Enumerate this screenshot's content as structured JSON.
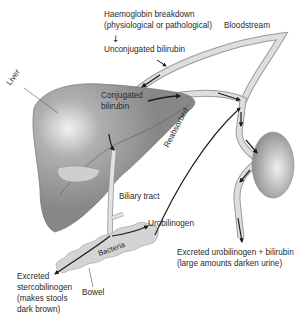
{
  "diagram": {
    "type": "biological-pathway",
    "colors": {
      "liver": "#8a8a8a",
      "liver_highlight": "#e8e8e8",
      "vessel_fill": "#dcdcdc",
      "vessel_stroke": "#9a9a9a",
      "kidney": "#9c9c9c",
      "bowel": "#d2d2d2",
      "arrow": "#1a1a1a",
      "text": "#2a2a2a"
    },
    "labels": {
      "haemoglobin_line1": "Haemoglobin breakdown",
      "haemoglobin_line2": "(physiological or pathological)",
      "unconjugated": "Unconjugated bilirubin",
      "bloodstream": "Bloodstream",
      "liver": "Liver",
      "conjugated_line1": "Conjugated",
      "conjugated_line2": "bilirubin",
      "reabsorbed": "Reabsorbed",
      "biliary_tract": "Biliary tract",
      "urobilinogen": "Urobilinogen",
      "bacteria": "Bacteria",
      "excreted_urine_line1": "Excreted urobilinogen + bilirubin",
      "excreted_urine_line2": "(large amounts darken urine)",
      "excreted_stool_line1": "Excreted",
      "excreted_stool_line2": "stercobilinogen",
      "excreted_stool_line3": "(makes stools",
      "excreted_stool_line4": "dark brown)",
      "bowel": "Bowel"
    },
    "arrows": {
      "down_arrow": "↓"
    }
  }
}
